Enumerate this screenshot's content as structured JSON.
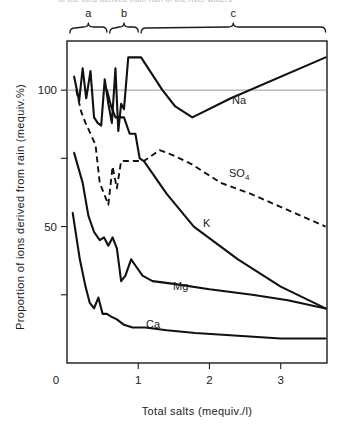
{
  "figure": {
    "cut_caption": "of the ions derived from rain in the river waters",
    "axis": {
      "y_title": "Proportion of ions derived from rain (mequiv.%)",
      "x_title": "Total salts (mequiv./l)",
      "y_tick_labels": [
        "100",
        "50"
      ],
      "x_tick_labels": [
        "0",
        "1",
        "2",
        "3"
      ],
      "y_ticks_values": [
        100,
        75,
        50,
        25
      ],
      "x_ticks_values": [
        0,
        1,
        2,
        3
      ],
      "xlim": [
        0,
        3.65
      ],
      "ylim": [
        0,
        118
      ],
      "reference_line_value": 100,
      "grid": false
    },
    "group_brackets": [
      {
        "label": "a",
        "x_start": 0.04,
        "x_end": 0.56
      },
      {
        "label": "b",
        "x_start": 0.6,
        "x_end": 1.0
      },
      {
        "label": "c",
        "x_start": 1.04,
        "x_end": 3.63
      }
    ],
    "series_labels": [
      {
        "name": "Na",
        "base": "Na",
        "sub": "",
        "x": 232,
        "y": 104
      },
      {
        "name": "SO4",
        "base": "SO",
        "sub": "4",
        "x": 229,
        "y": 177
      },
      {
        "name": "K",
        "base": "K",
        "sub": "",
        "x": 203,
        "y": 227
      },
      {
        "name": "Mg",
        "base": "Mg",
        "sub": "",
        "x": 173,
        "y": 290
      },
      {
        "name": "Ca",
        "base": "Ca",
        "sub": "",
        "x": 146,
        "y": 328
      }
    ]
  },
  "chart_data": {
    "type": "line",
    "title": "",
    "xlabel": "Total salts (mequiv./l)",
    "ylabel": "Proportion of ions derived from rain (mequiv.%)",
    "xlim": [
      0,
      3.65
    ],
    "ylim": [
      0,
      118
    ],
    "grid": false,
    "legend": "inline-curve-labels",
    "reference_lines": [
      {
        "axis": "y",
        "value": 100
      }
    ],
    "annotations": [
      {
        "text": "a",
        "meaning": "salinity group a",
        "x_range": [
          0.04,
          0.56
        ]
      },
      {
        "text": "b",
        "meaning": "salinity group b",
        "x_range": [
          0.6,
          1.0
        ]
      },
      {
        "text": "c",
        "meaning": "salinity group c",
        "x_range": [
          1.04,
          3.63
        ]
      }
    ],
    "series": [
      {
        "name": "Na",
        "style": "solid",
        "x": [
          0.1,
          0.17,
          0.22,
          0.27,
          0.33,
          0.38,
          0.43,
          0.48,
          0.53,
          0.58,
          0.63,
          0.68,
          0.72,
          0.76,
          0.8,
          0.86,
          0.92,
          0.98,
          1.04,
          1.34,
          1.52,
          1.76,
          2.3,
          3.63
        ],
        "y": [
          105,
          96,
          108,
          97,
          107,
          90,
          88,
          87,
          104,
          95,
          88,
          108,
          85,
          95,
          93,
          112,
          112,
          112,
          112,
          100,
          94,
          90,
          97,
          112
        ]
      },
      {
        "name": "SO4",
        "style": "dashed",
        "x": [
          0.13,
          0.2,
          0.26,
          0.33,
          0.4,
          0.46,
          0.52,
          0.58,
          0.64,
          0.7,
          0.76,
          0.84,
          0.96,
          1.08,
          1.3,
          1.5,
          1.74,
          2.16,
          2.58,
          3.63
        ],
        "y": [
          100,
          92,
          88,
          84,
          80,
          66,
          62,
          58,
          72,
          64,
          74,
          74,
          74,
          74,
          78,
          76,
          73,
          66,
          62,
          50
        ]
      },
      {
        "name": "K",
        "style": "solid",
        "x": [
          0.56,
          0.62,
          0.68,
          0.74,
          0.8,
          0.88,
          0.96,
          1.02,
          1.08,
          1.4,
          1.78,
          2.4,
          3.0,
          3.63
        ],
        "y": [
          100,
          94,
          90,
          90,
          90,
          84,
          84,
          75,
          74,
          62,
          50,
          38,
          28,
          20
        ]
      },
      {
        "name": "Mg",
        "style": "solid",
        "x": [
          0.1,
          0.22,
          0.3,
          0.38,
          0.46,
          0.52,
          0.58,
          0.64,
          0.7,
          0.76,
          0.82,
          0.9,
          0.98,
          1.06,
          1.2,
          1.5,
          2.0,
          2.6,
          3.1,
          3.63
        ],
        "y": [
          77,
          66,
          54,
          48,
          45,
          46,
          43,
          46,
          42,
          30,
          32,
          38,
          35,
          32,
          30,
          29,
          27,
          25,
          23,
          20
        ]
      },
      {
        "name": "Ca",
        "style": "solid",
        "x": [
          0.08,
          0.18,
          0.26,
          0.32,
          0.38,
          0.44,
          0.5,
          0.56,
          0.62,
          0.7,
          0.8,
          0.92,
          1.1,
          1.4,
          1.8,
          2.4,
          3.0,
          3.63
        ],
        "y": [
          55,
          38,
          28,
          22,
          20,
          24,
          18,
          18,
          17,
          16,
          14,
          13,
          13,
          12,
          11,
          10,
          9,
          9
        ]
      }
    ]
  }
}
